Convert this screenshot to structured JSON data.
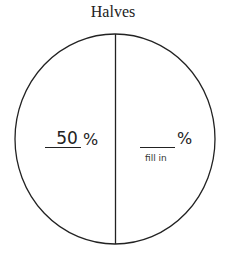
{
  "title": "Halves",
  "diagram": {
    "type": "circle-divided-in-halves",
    "stroke_color": "#222222",
    "left_half": {
      "value": "50",
      "unit": "%"
    },
    "right_half": {
      "value": "",
      "unit": "%",
      "hint": "fill in"
    }
  }
}
